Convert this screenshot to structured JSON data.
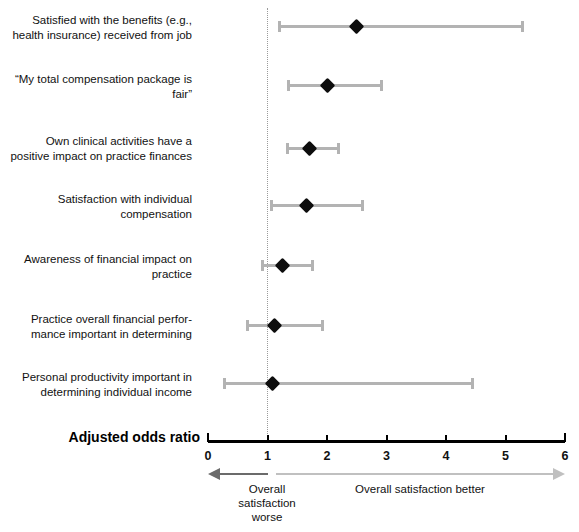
{
  "chart_data": {
    "type": "scatter",
    "subtype": "forest-plot",
    "title": "",
    "xlabel": "Adjusted odds ratio",
    "ylabel": "",
    "xlim": [
      0,
      6
    ],
    "xticks": [
      "0",
      "1",
      "2",
      "3",
      "4",
      "5",
      "6"
    ],
    "grid": false,
    "reference_line": 1,
    "legend": "none",
    "categories": [
      "Satisfied with the benefits (e.g.,\nhealth insurance) received from job",
      "“My total compensation package is\nfair”",
      "Own clinical activities have a\npositive impact on practice finances",
      "Satisfaction with individual\ncompensation",
      "Awareness of financial impact on\npractice",
      "Practice overall financial perfor-\nmance important in determining",
      "Personal productivity important in\ndetermining individual income"
    ],
    "points": [
      {
        "label": "Satisfied with the benefits (e.g., health insurance) received from job",
        "odds_ratio": 2.5,
        "ci_low": 1.21,
        "ci_high": 5.28
      },
      {
        "label": "“My total compensation package is fair”",
        "odds_ratio": 2.0,
        "ci_low": 1.36,
        "ci_high": 2.92
      },
      {
        "label": "Own clinical activities have a positive impact on practice finances",
        "odds_ratio": 1.71,
        "ci_low": 1.33,
        "ci_high": 2.2
      },
      {
        "label": "Satisfaction with individual compensation",
        "odds_ratio": 1.66,
        "ci_low": 1.06,
        "ci_high": 2.59
      },
      {
        "label": "Awareness of financial impact on practice",
        "odds_ratio": 1.26,
        "ci_low": 0.91,
        "ci_high": 1.75
      },
      {
        "label": "Practice overall financial performance important in determining",
        "odds_ratio": 1.12,
        "ci_low": 0.66,
        "ci_high": 1.93
      },
      {
        "label": "Personal productivity important in determining individual income",
        "odds_ratio": 1.09,
        "ci_low": 0.27,
        "ci_high": 4.45
      }
    ],
    "annotations": [
      {
        "name": "worse-direction",
        "text": "Overall\nsatisfaction\nworse",
        "direction": "left"
      },
      {
        "name": "better-direction",
        "text": "Overall satisfaction better",
        "direction": "right"
      }
    ],
    "colors": {
      "point": "#0d0d0d",
      "interval": "#b3b3b3",
      "axis": "#000000",
      "reference_line": "#9a9a9a",
      "arrow_left": "#6b6b6b",
      "arrow_right": "#c0c0c0",
      "background": "#ffffff"
    }
  },
  "axis": {
    "title": "Adjusted odds ratio",
    "ticks": [
      "0",
      "1",
      "2",
      "3",
      "4",
      "5",
      "6"
    ]
  },
  "annotations": {
    "worse": "Overall\nsatisfaction\nworse",
    "better": "Overall satisfaction better"
  },
  "rows": [
    {
      "label": "Satisfied with the benefits (e.g.,\nhealth insurance) received from job"
    },
    {
      "label": "“My total compensation package is\nfair”"
    },
    {
      "label": "Own clinical activities have a\npositive impact on practice finances"
    },
    {
      "label": "Satisfaction with individual\ncompensation"
    },
    {
      "label": "Awareness of financial impact on\npractice"
    },
    {
      "label": "Practice overall financial perfor-\nmance important in determining"
    },
    {
      "label": "Personal productivity important in\ndetermining individual income"
    }
  ]
}
